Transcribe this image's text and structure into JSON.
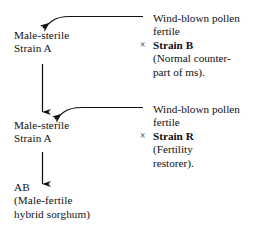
{
  "diagram": {
    "background_color": "#ffffff",
    "ink_color": "#111111",
    "stages": [
      {
        "female_parent": {
          "line1": "Male-sterile",
          "line2": "Strain A"
        },
        "pollen_source": {
          "line1": "Wind-blown pollen",
          "line2": "fertile",
          "cross_symbol": "×",
          "strain_label": "Strain B",
          "note_line1": "(Normal counter-",
          "note_line2": "part of ms)."
        }
      },
      {
        "female_parent": {
          "line1": "Male-sterile",
          "line2": "Strain A"
        },
        "pollen_source": {
          "line1": "Wind-blown pollen",
          "line2": "fertile",
          "cross_symbol": "×",
          "strain_label": "Strain R",
          "note_line1": "(Fertility",
          "note_line2": "restorer)."
        }
      }
    ],
    "result": {
      "line1": "AB",
      "line2": "(Male-fertile",
      "line3": "hybrid sorghum)"
    }
  }
}
